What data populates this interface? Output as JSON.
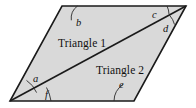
{
  "figure": {
    "title": "Parallelogram divided by a diagonal into two triangles",
    "background_color": "#ffffff",
    "fill_color": "#d9d9d9",
    "stroke_color": "#1a1a1a",
    "width": 196,
    "height": 108,
    "vertices": {
      "top_left": [
        62,
        6
      ],
      "top_right": [
        186,
        6
      ],
      "bottom_right": [
        134,
        101
      ],
      "bottom_left": [
        10,
        101
      ]
    },
    "diagonal": {
      "from": [
        10,
        101
      ],
      "to": [
        186,
        6
      ]
    },
    "regions": [
      {
        "id": "triangle-1",
        "label": "Triangle 1",
        "x": 58,
        "y": 47
      },
      {
        "id": "triangle-2",
        "label": "Triangle 2",
        "x": 96,
        "y": 74
      }
    ],
    "angles": [
      {
        "id": "b",
        "label": "b",
        "vertex": "top_left",
        "label_x": 76,
        "label_y": 26
      },
      {
        "id": "c",
        "label": "c",
        "vertex": "top_right",
        "label_x": 152,
        "label_y": 18
      },
      {
        "id": "d",
        "label": "d",
        "vertex": "top_right",
        "label_x": 163,
        "label_y": 32
      },
      {
        "id": "a",
        "label": "a",
        "vertex": "bottom_left",
        "label_x": 33,
        "label_y": 82
      },
      {
        "id": "f",
        "label": "f",
        "vertex": "bottom_left",
        "label_x": 45,
        "label_y": 98
      },
      {
        "id": "e",
        "label": "e",
        "vertex": "bottom_right",
        "label_x": 119,
        "label_y": 88
      }
    ]
  }
}
